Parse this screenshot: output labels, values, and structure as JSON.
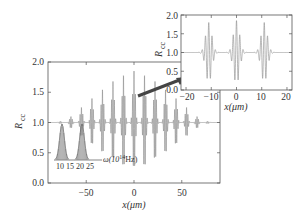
{
  "chart_data": [
    {
      "type": "line",
      "title": "",
      "xlabel": "x(μm)",
      "ylabel": "R_cc",
      "xlim": [
        -90,
        90
      ],
      "ylim": [
        0.0,
        2.0
      ],
      "xticks": [
        -50,
        0,
        50
      ],
      "xtick_labels": [
        "−50",
        "0",
        "50"
      ],
      "yticks": [
        0.0,
        0.5,
        1.0,
        1.5,
        2.0
      ],
      "ytick_labels": [
        "0.0",
        "0.5",
        "1.0",
        "1.5",
        "2.0"
      ],
      "baseline": 1.0,
      "series": [
        {
          "name": "R_cc oscillation bursts",
          "burst_centers": [
            -77,
            -66,
            -55,
            -44,
            -33,
            -22,
            -11,
            0,
            11,
            22,
            33,
            44,
            55,
            66,
            77
          ],
          "burst_max": [
            1.02,
            1.1,
            1.25,
            1.4,
            1.55,
            1.68,
            1.8,
            1.85,
            1.8,
            1.68,
            1.55,
            1.4,
            1.25,
            1.1,
            1.02
          ],
          "burst_min": [
            0.98,
            0.9,
            0.75,
            0.6,
            0.45,
            0.32,
            0.2,
            0.15,
            0.2,
            0.32,
            0.45,
            0.6,
            0.75,
            0.9,
            0.98
          ]
        }
      ],
      "grid": false
    },
    {
      "type": "bar",
      "title": "spectrum inset",
      "xlabel": "ω(10^14Hz)",
      "xtick_labels": [
        "10",
        "15",
        "20",
        "25"
      ],
      "peaks": [
        {
          "center": 12,
          "height": 0.8
        },
        {
          "center": 22,
          "height": 0.8
        }
      ]
    },
    {
      "type": "line",
      "title": "zoom inset",
      "xlabel": "x(μm)",
      "ylabel": "R_cc",
      "xlim": [
        -20,
        20
      ],
      "ylim": [
        0.0,
        2.0
      ],
      "xticks": [
        -20,
        -10,
        0,
        10,
        20
      ],
      "xtick_labels": [
        "−20",
        "−10",
        "0",
        "10",
        "20"
      ],
      "yticks": [
        0.0,
        0.5,
        1.0,
        1.5,
        2.0
      ],
      "ytick_labels": [
        "0.0",
        "0.5",
        "1.0",
        "1.5",
        "2.0"
      ],
      "series": [
        {
          "name": "R_cc zoomed",
          "burst_centers": [
            -11,
            0,
            11
          ],
          "burst_max": [
            1.8,
            1.85,
            1.8
          ],
          "burst_min": [
            0.2,
            0.15,
            0.2
          ]
        }
      ]
    }
  ],
  "main": {
    "ylabel_main": "R",
    "ylabel_sub": "cc",
    "xlabel": "x(μm)",
    "yticks": [
      "2.0",
      "1.5",
      "1.0",
      "0.5",
      "0.0"
    ],
    "xticks": [
      "−50",
      "0",
      "50"
    ]
  },
  "spectrum": {
    "ticks": [
      "10",
      "15",
      "20",
      "25"
    ],
    "label": "ω(10",
    "label_sup": "14",
    "label_end": "Hz)"
  },
  "inset": {
    "ylabel_main": "R",
    "ylabel_sub": "cc",
    "xlabel": "x(μm)",
    "yticks": [
      "2.0",
      "1.5",
      "1.0",
      "0.5",
      "0.0"
    ],
    "xticks": [
      "−20",
      "−10",
      "0",
      "10",
      "20"
    ]
  },
  "colors": {
    "curve": "#8a8a8a",
    "axis": "#555555",
    "arrow": "#444444"
  }
}
